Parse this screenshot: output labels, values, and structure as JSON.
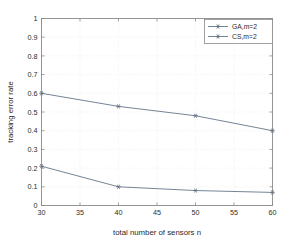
{
  "chart_data": {
    "type": "line",
    "title": "",
    "xlabel": "total number of sensors n",
    "ylabel": "tracking error rate",
    "x": [
      30,
      40,
      50,
      60
    ],
    "xlim": [
      30,
      60
    ],
    "ylim": [
      0,
      1
    ],
    "xticks": [
      30,
      35,
      40,
      45,
      50,
      55,
      60
    ],
    "yticks": [
      0,
      0.1,
      0.2,
      0.3,
      0.4,
      0.5,
      0.6,
      0.7,
      0.8,
      0.9,
      1
    ],
    "xtick_labels": [
      "30",
      "35",
      "40",
      "45",
      "50",
      "55",
      "60"
    ],
    "ytick_labels": [
      "0",
      "0.1",
      "0.2",
      "0.3",
      "0.4",
      "0.5",
      "0.6",
      "0.7",
      "0.8",
      "0.9",
      "1"
    ],
    "grid": true,
    "legend_position": "upper right",
    "series": [
      {
        "name": "GA,m=2",
        "values": [
          0.21,
          0.1,
          0.08,
          0.07
        ],
        "color": "#6e7d8f",
        "marker": "asterisk"
      },
      {
        "name": "CS,m=2",
        "values": [
          0.6,
          0.53,
          0.48,
          0.4
        ],
        "color": "#6e7d8f",
        "marker": "asterisk"
      }
    ]
  },
  "figure": {
    "background": "#ffffff",
    "axis_color": "#8a8a8a",
    "grid_color": "#e9e9e9"
  }
}
